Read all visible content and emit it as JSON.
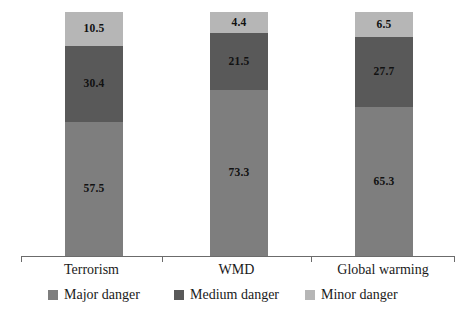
{
  "chart_data": {
    "type": "bar",
    "stacked": true,
    "orientation": "vertical",
    "title": "",
    "subtitle": "",
    "xlabel": "",
    "ylabel": "",
    "ylim": [
      0,
      100
    ],
    "grid": false,
    "legend_position": "bottom",
    "categories": [
      "Terrorism",
      "WMD",
      "Global warming"
    ],
    "series": [
      {
        "name": "Major danger",
        "color": "#7e7e7e",
        "values": [
          57.5,
          73.3,
          65.3
        ]
      },
      {
        "name": "Medium danger",
        "color": "#595959",
        "values": [
          30.4,
          21.5,
          27.7
        ]
      },
      {
        "name": "Minor danger",
        "color": "#b6b6b6",
        "values": [
          10.5,
          4.4,
          6.5
        ]
      }
    ],
    "data_labels": {
      "Terrorism": {
        "major": "57.5",
        "medium": "30.4",
        "minor": "10.5"
      },
      "WMD": {
        "major": "73.3",
        "medium": "21.5",
        "minor": "4.4"
      },
      "Global warming": {
        "major": "65.3",
        "medium": "27.7",
        "minor": "6.5"
      }
    },
    "axis": {
      "line_color": "#6b6b6b",
      "tick_count": 4
    }
  },
  "legend": {
    "items": [
      {
        "label": "Major danger",
        "swatch_name": "legend-swatch-major"
      },
      {
        "label": "Medium danger",
        "swatch_name": "legend-swatch-medium"
      },
      {
        "label": "Minor danger",
        "swatch_name": "legend-swatch-minor"
      }
    ]
  }
}
